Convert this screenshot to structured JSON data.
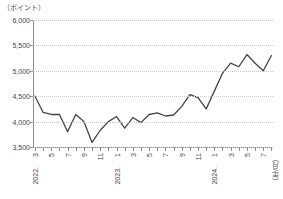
{
  "chart_data": {
    "type": "line",
    "title": "",
    "xlabel": "（年/月）",
    "ylabel": "（ポイント）",
    "y_unit_caption": "（ポイント）",
    "x_unit_caption": "（年/月）",
    "ylim": [
      3500,
      6000
    ],
    "ytick_labels": [
      "6,000",
      "5,500",
      "5,000",
      "4,500",
      "4,000",
      "3,500"
    ],
    "ytick_values": [
      6000,
      5500,
      5000,
      4500,
      4000,
      3500
    ],
    "grid": true,
    "legend": "none",
    "x_tick_labels": [
      "3",
      "5",
      "7",
      "9",
      "11",
      "1",
      "3",
      "5",
      "7",
      "9",
      "11",
      "1",
      "3",
      "5",
      "7"
    ],
    "x_year_labels": [
      {
        "index": 0,
        "label": "2022."
      },
      {
        "index": 10,
        "label": "2023."
      },
      {
        "index": 22,
        "label": "2024."
      }
    ],
    "x": [
      "2022/3",
      "2022/4",
      "2022/5",
      "2022/6",
      "2022/7",
      "2022/8",
      "2022/9",
      "2022/10",
      "2022/11",
      "2022/12",
      "2023/1",
      "2023/2",
      "2023/3",
      "2023/4",
      "2023/5",
      "2023/6",
      "2023/7",
      "2023/8",
      "2023/9",
      "2023/10",
      "2023/11",
      "2023/12",
      "2024/1",
      "2024/2",
      "2024/3",
      "2024/4",
      "2024/5",
      "2024/6",
      "2024/7",
      "2024/8"
    ],
    "values": [
      4500,
      4180,
      4140,
      4140,
      3800,
      4140,
      4000,
      3590,
      3830,
      4000,
      4100,
      3870,
      4080,
      3980,
      4140,
      4170,
      4110,
      4130,
      4300,
      4530,
      4470,
      4250,
      4600,
      4950,
      5150,
      5080,
      5320,
      5150,
      5000,
      5300
    ],
    "series_color": "#444444"
  }
}
